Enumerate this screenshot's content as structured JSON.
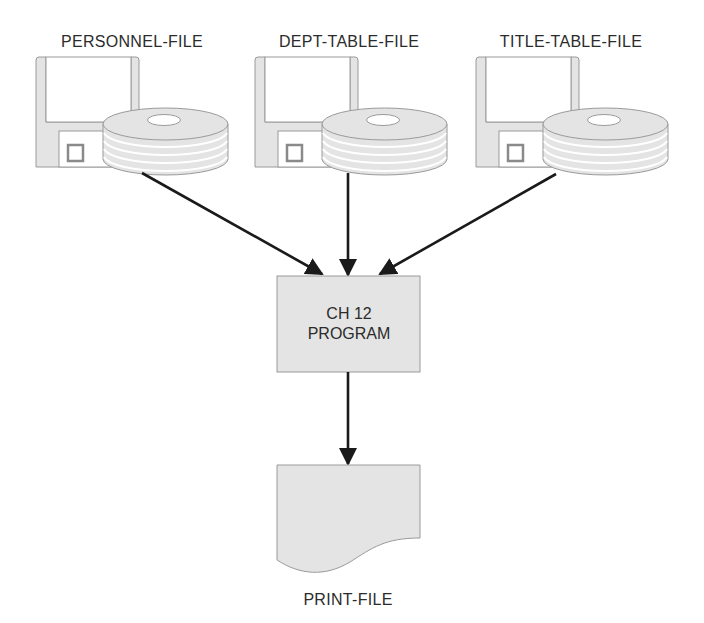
{
  "diagram": {
    "type": "system-flowchart",
    "colors": {
      "fill": "#e4e4e4",
      "stroke": "#9a9a9a",
      "arrow": "#1a1a1a",
      "text": "#2b2b2b",
      "background": "#ffffff"
    },
    "inputs": [
      {
        "id": "personnel-file",
        "label": "PERSONNEL-FILE",
        "icon": "disk-pack-with-floppy-icon"
      },
      {
        "id": "dept-table-file",
        "label": "DEPT-TABLE-FILE",
        "icon": "disk-pack-with-floppy-icon"
      },
      {
        "id": "title-table-file",
        "label": "TITLE-TABLE-FILE",
        "icon": "disk-pack-with-floppy-icon"
      }
    ],
    "process": {
      "id": "ch12-program",
      "line1": "CH 12",
      "line2": "PROGRAM",
      "shape": "rectangle"
    },
    "output": {
      "id": "print-file",
      "label": "PRINT-FILE",
      "shape": "document"
    },
    "edges": [
      {
        "from": "personnel-file",
        "to": "ch12-program"
      },
      {
        "from": "dept-table-file",
        "to": "ch12-program"
      },
      {
        "from": "title-table-file",
        "to": "ch12-program"
      },
      {
        "from": "ch12-program",
        "to": "print-file"
      }
    ]
  }
}
